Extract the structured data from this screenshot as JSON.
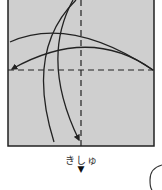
{
  "diagram": {
    "type": "origami-fold-step",
    "paper_color": "#cfcfcf",
    "line_color": "#222222",
    "caption": "きしゅ",
    "marker": "▼",
    "elements": [
      "square-paper",
      "vertical-valley-fold-line",
      "horizontal-valley-fold-line",
      "fold-arrow-horizontal",
      "fold-arrow-vertical",
      "next-step-partial-circle"
    ]
  }
}
